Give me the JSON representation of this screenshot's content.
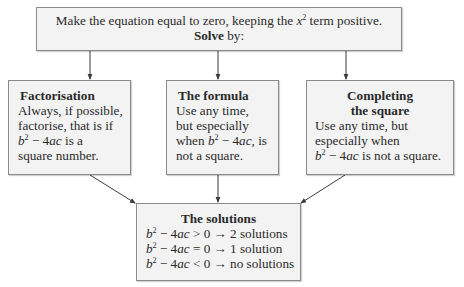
{
  "top_box": {
    "line1_pre": "Make the equation equal to zero, keeping the ",
    "line1_var": "x",
    "line1_exp": "2",
    "line1_post": " term positive.",
    "line2_bold": "Solve",
    "line2_rest": " by:"
  },
  "methods": [
    {
      "title": "Factorisation",
      "lines": [
        "Always, if possible,",
        "factorise, that is if"
      ],
      "expr_b": "b",
      "expr_exp": "2",
      "expr_mid": " − 4",
      "expr_ac": "ac",
      "expr_tail": " is a",
      "last": "square number."
    },
    {
      "title": "The formula",
      "lines": [
        "Use any time,",
        "but especially"
      ],
      "expr_pre": "when ",
      "expr_b": "b",
      "expr_exp": "2",
      "expr_mid": " − 4",
      "expr_ac": "ac,",
      "expr_tail": " is",
      "last": "not a square."
    },
    {
      "title_line1": "Completing",
      "title_line2": "the square",
      "lines": [
        "Use any time, but",
        "especially when"
      ],
      "expr_b": "b",
      "expr_exp": "2",
      "expr_mid": " − 4",
      "expr_ac": "ac",
      "expr_tail": " is not a square."
    }
  ],
  "solutions": {
    "title": "The solutions",
    "rows": [
      {
        "b": "b",
        "exp": "2",
        "mid": " − 4",
        "ac": "ac",
        "rel": " > 0 → 2 solutions"
      },
      {
        "b": "b",
        "exp": "2",
        "mid": " − 4",
        "ac": "ac",
        "rel": " = 0 → 1 solution"
      },
      {
        "b": "b",
        "exp": "2",
        "mid": " − 4",
        "ac": "ac",
        "rel": " < 0 → no solutions"
      }
    ]
  },
  "colors": {
    "box_fill": "#f3f3f3",
    "border": "#8a8a8a",
    "arrow": "#3a3a3a",
    "text": "#2a2a2a"
  }
}
